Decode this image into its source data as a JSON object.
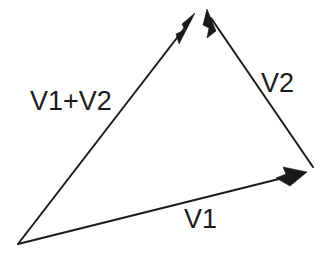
{
  "diagram": {
    "background_color": "#ffffff",
    "stroke_color": "#1a1a1a",
    "labels": {
      "resultant": "V1+V2",
      "vector_two": "V2",
      "vector_one": "V1"
    },
    "vectors": [
      {
        "name": "V1",
        "label": "V1",
        "tail": [
          18,
          244
        ],
        "head": [
          307,
          172
        ],
        "arrow_at": "head",
        "label_position": [
          184,
          206
        ]
      },
      {
        "name": "V2",
        "label": "V2",
        "tail": [
          313,
          167
        ],
        "head": [
          207,
          10
        ],
        "arrow_at": "head",
        "label_position": [
          261,
          70
        ]
      },
      {
        "name": "V1+V2",
        "label": "V1+V2",
        "tail": [
          18,
          244
        ],
        "head": [
          195,
          14
        ],
        "arrow_at": "head",
        "label_position": [
          30,
          88
        ]
      }
    ]
  }
}
